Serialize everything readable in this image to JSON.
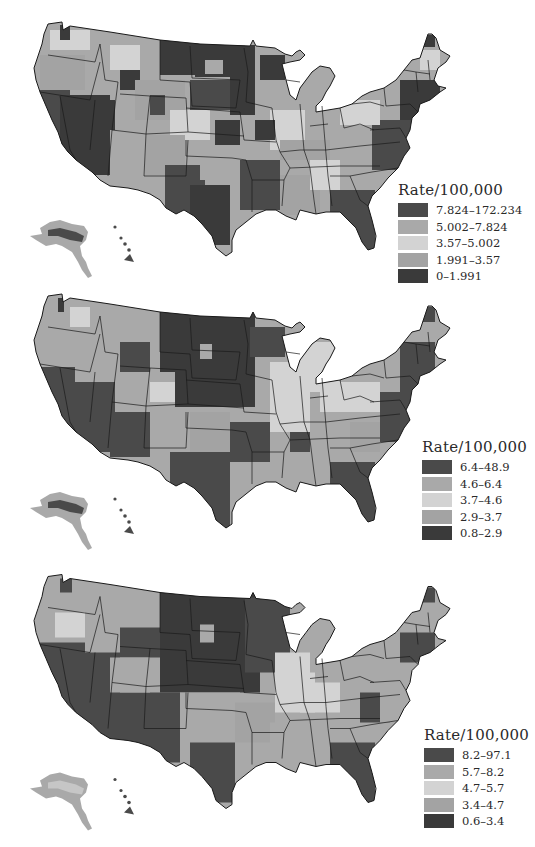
{
  "figure": {
    "type": "choropleth-map-series",
    "region": "United States (counties), with Alaska and Hawaii insets"
  },
  "palette": {
    "class1": "#4a4a4a",
    "class2": "#a9a9a9",
    "class3": "#d3d3d3",
    "class4": "#a3a3a3",
    "class5": "#3a3a3a",
    "border": "#1a1a1a",
    "background": "#ffffff"
  },
  "maps": [
    {
      "legend": {
        "title": "Rate/100,000",
        "classes": [
          {
            "label": "7.824–172.234",
            "color": "#4a4a4a"
          },
          {
            "label": "5.002–7.824",
            "color": "#a9a9a9"
          },
          {
            "label": "3.57–5.002",
            "color": "#d3d3d3"
          },
          {
            "label": "1.991–3.57",
            "color": "#a3a3a3"
          },
          {
            "label": "0–1.991",
            "color": "#3a3a3a"
          }
        ]
      }
    },
    {
      "legend": {
        "title": "Rate/100,000",
        "classes": [
          {
            "label": "6.4–48.9",
            "color": "#4a4a4a"
          },
          {
            "label": "4.6–6.4",
            "color": "#a9a9a9"
          },
          {
            "label": "3.7–4.6",
            "color": "#d3d3d3"
          },
          {
            "label": "2.9–3.7",
            "color": "#a3a3a3"
          },
          {
            "label": "0.8–2.9",
            "color": "#3a3a3a"
          }
        ]
      }
    },
    {
      "legend": {
        "title": "Rate/100,000",
        "classes": [
          {
            "label": "8.2–97.1",
            "color": "#4a4a4a"
          },
          {
            "label": "5.7–8.2",
            "color": "#a9a9a9"
          },
          {
            "label": "4.7–5.7",
            "color": "#d3d3d3"
          },
          {
            "label": "3.4–4.7",
            "color": "#a3a3a3"
          },
          {
            "label": "0.6–3.4",
            "color": "#3a3a3a"
          }
        ]
      }
    }
  ]
}
